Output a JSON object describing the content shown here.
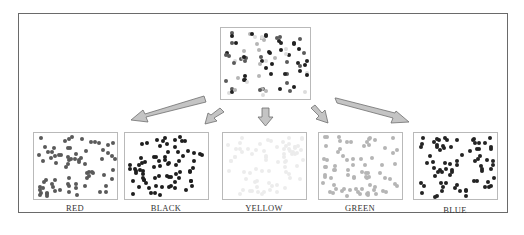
{
  "diagram": {
    "source_panel": {
      "name": "mixed",
      "dot_color": "mixed"
    },
    "panels": [
      {
        "label": "RED",
        "dot_color": "#5a5a5a"
      },
      {
        "label": "BLACK",
        "dot_color": "#1e1e1e"
      },
      {
        "label": "YELLOW",
        "dot_color": "#ececec"
      },
      {
        "label": "GREEN",
        "dot_color": "#b5b5b5"
      },
      {
        "label": "BLUE",
        "dot_color": "#232323"
      }
    ],
    "arrow_color": "#c4c4c4",
    "arrow_stroke": "#6e6e6e"
  }
}
